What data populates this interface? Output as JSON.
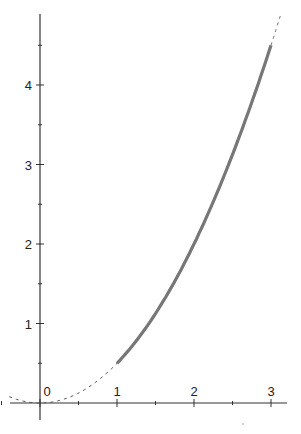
{
  "chart_data": {
    "type": "line",
    "title": "",
    "xlabel": "",
    "ylabel": "",
    "xlim": [
      -0.4,
      3.2
    ],
    "ylim": [
      -0.35,
      4.9
    ],
    "x_ticks": [
      "0",
      "1",
      "2",
      "3"
    ],
    "y_ticks": [
      "1",
      "2",
      "3",
      "4"
    ],
    "grid": false,
    "series": [
      {
        "name": "y = x^2/2 (highlighted segment, solid)",
        "style": "solid-thick",
        "x": [
          1.0,
          1.5,
          2.0,
          2.5,
          3.0
        ],
        "values": [
          0.5,
          1.125,
          2.0,
          3.125,
          4.5
        ]
      },
      {
        "name": "y = x^2/2 (continuation, dashed)",
        "style": "dashed",
        "x": [
          -0.4,
          0.0,
          0.5,
          1.0,
          3.0,
          3.1
        ],
        "values": [
          0.08,
          0.0,
          0.125,
          0.5,
          4.5,
          4.8
        ]
      }
    ],
    "colors": {
      "axis": "#333333",
      "curve": "#777777",
      "dashed": "#555555"
    }
  }
}
